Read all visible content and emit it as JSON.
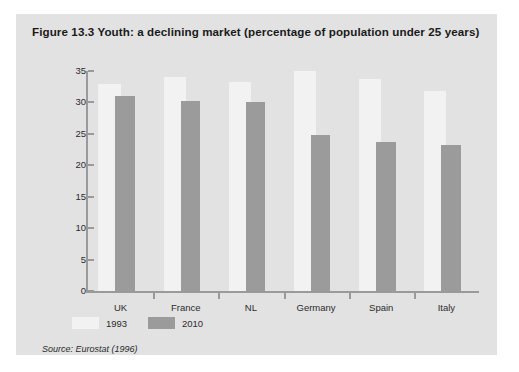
{
  "figure": {
    "number": "Figure 13.3",
    "title": "Youth: a declining market (percentage of population under 25 years)",
    "caption_full": "Figure 13.3  Youth: a declining market (percentage of population under 25 years)",
    "source": "Source: Eurostat (1996)",
    "panel_color": "#e2e2e2"
  },
  "legend": {
    "position": "below-axis-left",
    "entries": [
      {
        "label": "1993",
        "color": "#f2f2f2"
      },
      {
        "label": "2010",
        "color": "#9b9b9b"
      }
    ]
  },
  "chart_data": {
    "type": "bar",
    "title": "Youth: a declining market (percentage of population under 25 years)",
    "xlabel": "",
    "ylabel": "",
    "ylim": [
      0,
      35
    ],
    "yticks": [
      0,
      5,
      10,
      15,
      20,
      25,
      30,
      35
    ],
    "ytick_labels": [
      "0",
      "5",
      "10",
      "15",
      "20",
      "25",
      "30",
      "35"
    ],
    "grid": false,
    "legend_position": "bottom-left",
    "categories": [
      "UK",
      "France",
      "NL",
      "Germany",
      "Spain",
      "Italy"
    ],
    "series": [
      {
        "name": "1993",
        "color": "#f2f2f2",
        "values": [
          33.0,
          34.0,
          33.2,
          35.0,
          33.8,
          31.8
        ]
      },
      {
        "name": "2010",
        "color": "#9b9b9b",
        "values": [
          31.0,
          30.2,
          30.0,
          24.8,
          23.7,
          23.2
        ]
      }
    ]
  }
}
